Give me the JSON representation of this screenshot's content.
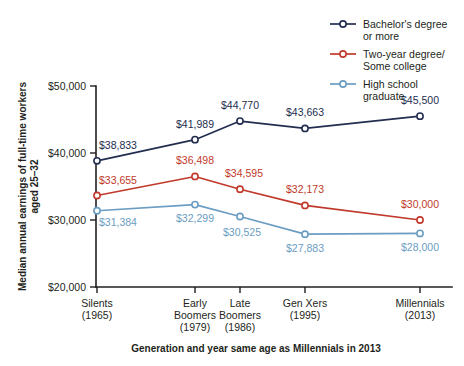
{
  "chart_data": {
    "type": "line",
    "title": "",
    "xlabel": "Generation and year same age as Millennials in 2013",
    "ylabel": "Median annual earnings of full-time workers aged 25–32",
    "categories": [
      "Silents",
      "Early Boomers",
      "Late Boomers",
      "Gen Xers",
      "Millennials"
    ],
    "category_lines": [
      [
        "Silents",
        "(1965)"
      ],
      [
        "Early",
        "Boomers",
        "(1979)"
      ],
      [
        "Late",
        "Boomers",
        "(1986)"
      ],
      [
        "Gen Xers",
        "(1995)"
      ],
      [
        "Millennials",
        "(2013)"
      ]
    ],
    "category_years": [
      "1965",
      "1979",
      "1986",
      "1995",
      "2013"
    ],
    "x_positions": [
      97,
      195,
      240,
      305,
      420
    ],
    "ylim": [
      20000,
      50000
    ],
    "ytick_values": [
      20000,
      30000,
      40000,
      50000
    ],
    "ytick_labels": [
      "$20,000",
      "$30,000",
      "$40,000",
      "$50,000"
    ],
    "grid": false,
    "legend_position": "top-right",
    "series": [
      {
        "name": "Bachelor's degree or more",
        "name_lines": [
          "Bachelor's degree",
          "or more"
        ],
        "color": "#232d4f",
        "values": [
          38833,
          41989,
          44770,
          43663,
          45500
        ],
        "labels": [
          "$38,833",
          "$41,989",
          "$44,770",
          "$43,663",
          "$45,500"
        ],
        "label_offsets": [
          {
            "dx": 2,
            "dy": -12,
            "anchor": "start"
          },
          {
            "dx": 0,
            "dy": -12,
            "anchor": "middle"
          },
          {
            "dx": 0,
            "dy": -12,
            "anchor": "middle"
          },
          {
            "dx": 0,
            "dy": -12,
            "anchor": "middle"
          },
          {
            "dx": 0,
            "dy": -12,
            "anchor": "middle"
          }
        ]
      },
      {
        "name": "Two-year degree/ Some college",
        "name_lines": [
          "Two-year degree/",
          "Some college"
        ],
        "color": "#c0392b",
        "values": [
          33655,
          36498,
          34595,
          32173,
          30000
        ],
        "labels": [
          "$33,655",
          "$36,498",
          "$34,595",
          "$32,173",
          "$30,000"
        ],
        "label_offsets": [
          {
            "dx": 2,
            "dy": -12,
            "anchor": "start"
          },
          {
            "dx": 0,
            "dy": -12,
            "anchor": "middle"
          },
          {
            "dx": 4,
            "dy": -12,
            "anchor": "middle"
          },
          {
            "dx": 0,
            "dy": -12,
            "anchor": "middle"
          },
          {
            "dx": 0,
            "dy": -12,
            "anchor": "middle"
          }
        ]
      },
      {
        "name": "High school graduate",
        "name_lines": [
          "High school",
          "graduate"
        ],
        "color": "#6b9dc2",
        "values": [
          31384,
          32299,
          30525,
          27883,
          28000
        ],
        "labels": [
          "$31,384",
          "$32,299",
          "$30,525",
          "$27,883",
          "$28,000"
        ],
        "label_offsets": [
          {
            "dx": 2,
            "dy": 15,
            "anchor": "start"
          },
          {
            "dx": 0,
            "dy": 17,
            "anchor": "middle"
          },
          {
            "dx": 2,
            "dy": 20,
            "anchor": "middle"
          },
          {
            "dx": 0,
            "dy": 18,
            "anchor": "middle"
          },
          {
            "dx": 0,
            "dy": 18,
            "anchor": "middle"
          }
        ]
      }
    ]
  },
  "colors": {
    "bachelor": "#232d4f",
    "two_year": "#c0392b",
    "high_school": "#6b9dc2",
    "axis": "#231f20",
    "background": "#ffffff"
  }
}
